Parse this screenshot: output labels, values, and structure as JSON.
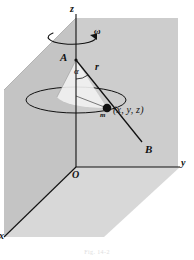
{
  "figure": {
    "caption": "Fig. 14-2",
    "background_color": "#ffffff",
    "ink_color": "#111111",
    "plane_fill_vertical": "#c9c9c9",
    "plane_fill_horizontal": "#d6d6d6",
    "wedge_fill": "#efefef"
  },
  "axes": {
    "z": {
      "label": "z",
      "x": 76,
      "y_top": 14,
      "y_bottom": 167
    },
    "y": {
      "label": "y",
      "x_start": 76,
      "x_end": 180,
      "y": 167
    },
    "x": {
      "label": "x",
      "x_start": 76,
      "y_start": 167,
      "x_end": 4,
      "y_end": 237
    },
    "origin": {
      "label": "O",
      "x": 76,
      "y": 167
    }
  },
  "labels": {
    "omega": "ω",
    "point_A": "A",
    "point_B": "B",
    "angle_alpha": "α",
    "radius_r": "r",
    "mass_m": "m",
    "coordinates": "(x, y, z)",
    "origin": "O",
    "axis_z": "z",
    "axis_y": "y",
    "axis_x": "x"
  },
  "geometry": {
    "point_A": {
      "x": 76,
      "y": 60
    },
    "point_m": {
      "x": 107,
      "y": 108
    },
    "point_B": {
      "x": 142,
      "y": 142
    },
    "orbit_ellipse": {
      "cx": 76,
      "cy": 100,
      "rx": 50,
      "ry": 13
    },
    "rotation_arrow_ellipse": {
      "cx": 76,
      "cy": 36,
      "rx": 24,
      "ry": 7
    },
    "vertical_plane": "xz-plane, shaded grey quadrilateral",
    "horizontal_plane": "xy-plane, shaded grey quadrilateral"
  }
}
